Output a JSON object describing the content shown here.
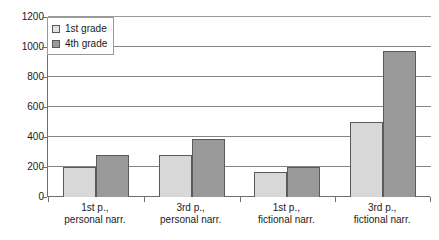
{
  "chart_data": {
    "type": "bar",
    "title": "",
    "xlabel": "",
    "ylabel": "",
    "ylim": [
      0,
      1200
    ],
    "ytick_step": 200,
    "yticks": [
      1200,
      1000,
      800,
      600,
      400,
      200,
      0
    ],
    "grid": "horizontal",
    "legend_position": "top-left-inside",
    "categories": [
      "1st p., personal narr.",
      "3rd p., personal narr.",
      "1st p., fictional narr.",
      "3rd p., fictional narr."
    ],
    "category_lines": [
      [
        "1st p.,",
        "personal narr."
      ],
      [
        "3rd p.,",
        "personal narr."
      ],
      [
        "1st p.,",
        "fictional narr."
      ],
      [
        "3rd p.,",
        "fictional narr."
      ]
    ],
    "series": [
      {
        "name": "1st grade",
        "color": "#d8d8d8",
        "values": [
          200,
          280,
          165,
          500
        ]
      },
      {
        "name": "4th grade",
        "color": "#9a9a9a",
        "values": [
          280,
          390,
          200,
          975
        ]
      }
    ]
  },
  "legend": {
    "items": [
      {
        "label": "1st grade",
        "swatch": "legend-swatch-1st-grade"
      },
      {
        "label": "4th grade",
        "swatch": "legend-swatch-4th-grade"
      }
    ]
  },
  "axis": {
    "y_labels": [
      "1200",
      "1000",
      "800",
      "600",
      "400",
      "200",
      "0"
    ]
  },
  "colors": {
    "series_1": "#d8d8d8",
    "series_2": "#9a9a9a",
    "axis": "#6e6e6e",
    "gridline": "#858585",
    "bar_border": "#5a5a5a",
    "background": "#ffffff",
    "text": "#1a1a1a"
  }
}
